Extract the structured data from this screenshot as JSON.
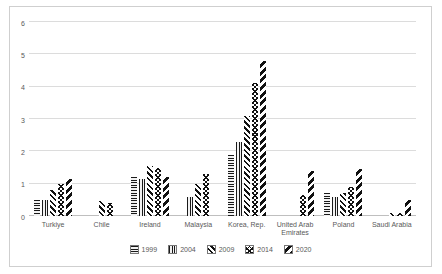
{
  "chart_data": {
    "type": "bar",
    "title": "",
    "xlabel": "",
    "ylabel": "",
    "ylim": [
      0,
      6
    ],
    "y_ticks": [
      "0",
      "1",
      "2",
      "3",
      "4",
      "5",
      "6"
    ],
    "grid": true,
    "legend_position": "bottom",
    "categories": [
      "Turkiye",
      "Chile",
      "Ireland",
      "Malaysia",
      "Korea, Rep.",
      "United Arab Emirates",
      "Poland",
      "Saudi Arabia"
    ],
    "series": [
      {
        "name": "1999",
        "pattern": "horizontal-stripes",
        "values": [
          0.5,
          0,
          1.2,
          0,
          1.9,
          0,
          0.7,
          0
        ]
      },
      {
        "name": "2004",
        "pattern": "vertical-stripes",
        "values": [
          0.5,
          0,
          1.15,
          0.6,
          2.3,
          0,
          0.6,
          0
        ]
      },
      {
        "name": "2009",
        "pattern": "thin-diagonal",
        "values": [
          0.8,
          0.45,
          1.55,
          1.0,
          3.1,
          0,
          0.7,
          0.1
        ]
      },
      {
        "name": "2014",
        "pattern": "checkerboard",
        "values": [
          1.0,
          0.4,
          1.5,
          1.3,
          4.1,
          0.65,
          0.9,
          0.1
        ]
      },
      {
        "name": "2020",
        "pattern": "wide-diagonal",
        "values": [
          1.15,
          0,
          1.2,
          0,
          4.8,
          1.4,
          1.45,
          0.5
        ]
      }
    ]
  },
  "colors": {
    "background": "#ffffff",
    "frame_border": "#cfcfcf",
    "gridline": "#dcdcdc",
    "axis_line": "#bfbfbf",
    "text": "#595959",
    "bar_pattern": "#111111"
  }
}
